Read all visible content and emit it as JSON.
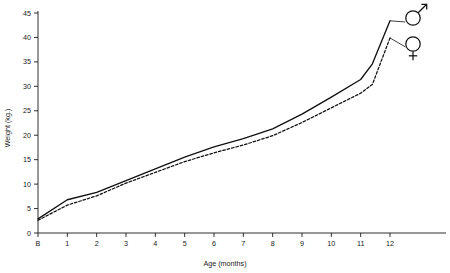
{
  "chart_data": {
    "type": "line",
    "title": "",
    "xlabel": "Age (months)",
    "ylabel": "Weight (kg.)",
    "x_tick_labels": [
      "B",
      "1",
      "2",
      "3",
      "4",
      "5",
      "6",
      "7",
      "8",
      "9",
      "10",
      "11",
      "12"
    ],
    "x_values": [
      0,
      1,
      2,
      3,
      4,
      5,
      6,
      7,
      8,
      9,
      10,
      11,
      12
    ],
    "y_tick_labels": [
      "0",
      "5",
      "10",
      "15",
      "20",
      "25",
      "30",
      "35",
      "40",
      "45"
    ],
    "y_ticks": [
      0,
      5,
      10,
      15,
      20,
      25,
      30,
      35,
      40,
      45
    ],
    "ylim": [
      0,
      45
    ],
    "xlim": [
      0,
      12
    ],
    "grid": false,
    "legend_position": "right-inside-top",
    "series": [
      {
        "name": "Male",
        "symbol": "♂",
        "line_style": "solid",
        "color": "#111111",
        "values": [
          2.9,
          6.8,
          8.3,
          10.7,
          13.1,
          15.5,
          17.6,
          19.3,
          21.3,
          24.3,
          27.8,
          31.4,
          34.6,
          43.4
        ],
        "x": [
          0,
          1,
          2,
          3,
          4,
          5,
          6,
          7,
          8,
          9,
          10,
          11,
          11.4,
          12
        ]
      },
      {
        "name": "Female",
        "symbol": "♀",
        "line_style": "dashed",
        "color": "#111111",
        "values": [
          2.6,
          5.7,
          7.6,
          10.2,
          12.4,
          14.6,
          16.4,
          18.0,
          19.9,
          22.6,
          25.6,
          28.6,
          30.4,
          39.9
        ],
        "x": [
          0,
          1,
          2,
          3,
          4,
          5,
          6,
          7,
          8,
          9,
          10,
          11,
          11.4,
          12
        ]
      }
    ],
    "annotations": [
      {
        "name": "male-symbol",
        "glyph": "♂",
        "series": "Male"
      },
      {
        "name": "female-symbol",
        "glyph": "♀",
        "series": "Female"
      }
    ]
  }
}
